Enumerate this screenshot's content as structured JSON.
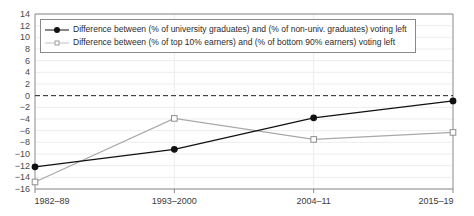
{
  "chart_data": {
    "type": "line",
    "title": "",
    "xlabel": "",
    "ylabel": "",
    "categories": [
      "1982–89",
      "1993–2000",
      "2004–11",
      "2015–19"
    ],
    "yticks": [
      14,
      12,
      10,
      8,
      6,
      4,
      2,
      0,
      -2,
      -4,
      -6,
      -8,
      -10,
      -12,
      -14,
      -16
    ],
    "ylim": [
      -16,
      14
    ],
    "grid": true,
    "zero_line": true,
    "legend_position": "top-left-inside",
    "series": [
      {
        "name": "Difference between (% of university graduates) and (% of non-univ. graduates) voting left",
        "marker": "filled-circle",
        "color": "#111111",
        "values": [
          -12.2,
          -9.2,
          -3.8,
          -0.9
        ]
      },
      {
        "name": "Difference between (% of top 10% earners) and (% of bottom 90% earners) voting left",
        "marker": "open-square",
        "color": "#a8a8a8",
        "values": [
          -14.8,
          -3.9,
          -7.5,
          -6.3
        ]
      }
    ]
  },
  "legend": {
    "items": [
      {
        "label": "Difference between (% of university graduates) and (% of non-univ. graduates) voting left",
        "marker": "filled-circle"
      },
      {
        "label": "Difference between (% of top 10% earners) and (% of bottom 90% earners) voting left",
        "marker": "open-square"
      }
    ]
  },
  "colors": {
    "series_1": "#111111",
    "series_2": "#a8a8a8",
    "axis": "#8a8a8a",
    "grid": "#ededed",
    "zero_line": "#222222",
    "tick_text": "#4a4a4a"
  }
}
